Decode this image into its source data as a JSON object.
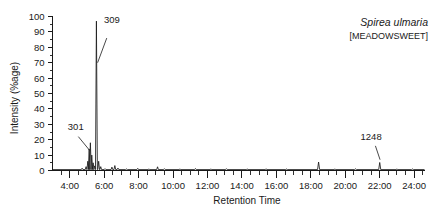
{
  "figure": {
    "species_name": "Spirea ulmaria",
    "common_name": "[MEADOWSWEET]"
  },
  "chart_data": {
    "type": "line",
    "title": "Spirea ulmaria",
    "subtitle": "[MEADOWSWEET]",
    "xlabel": "Retention Time",
    "ylabel": "Intensity (%age)",
    "xlim": [
      3.0,
      24.6
    ],
    "ylim": [
      0,
      100
    ],
    "grid": false,
    "legend": "none",
    "x_tick_labels": [
      "4:00",
      "6:00",
      "8:00",
      "10:00",
      "12:00",
      "14:00",
      "16:00",
      "18:00",
      "20:00",
      "22:00",
      "24:00"
    ],
    "x_tick_values": [
      4,
      6,
      8,
      10,
      12,
      14,
      16,
      18,
      20,
      22,
      24
    ],
    "x_minor_interval": 0.5,
    "y_tick_labels": [
      "0",
      "10",
      "20",
      "30",
      "40",
      "50",
      "60",
      "70",
      "80",
      "90",
      "100"
    ],
    "y_tick_values": [
      0,
      10,
      20,
      30,
      40,
      50,
      60,
      70,
      80,
      90,
      100
    ],
    "y_minor_interval": 5,
    "annotations": [
      {
        "label": "309",
        "x": 5.55,
        "y": 97,
        "label_x": 6.45,
        "label_y": 96,
        "leader_from_x": 6.15,
        "leader_from_y": 86,
        "leader_to_x": 5.62,
        "leader_to_y": 70
      },
      {
        "label": "301",
        "x": 5.2,
        "y": 18,
        "label_x": 4.35,
        "label_y": 26,
        "leader_from_x": 4.5,
        "leader_from_y": 22,
        "leader_to_x": 5.16,
        "leader_to_y": 13
      },
      {
        "label": "1248",
        "x": 22.0,
        "y": 5,
        "label_x": 21.5,
        "label_y": 20,
        "leader_from_x": 21.75,
        "leader_from_y": 16,
        "leader_to_x": 22.02,
        "leader_to_y": 7
      }
    ],
    "peaks": [
      {
        "x": 4.72,
        "y": 1.5,
        "w": 0.05
      },
      {
        "x": 4.95,
        "y": 2.5,
        "w": 0.05
      },
      {
        "x": 5.05,
        "y": 6.0,
        "w": 0.05
      },
      {
        "x": 5.13,
        "y": 14.0,
        "w": 0.05
      },
      {
        "x": 5.2,
        "y": 18.0,
        "w": 0.05
      },
      {
        "x": 5.28,
        "y": 10.0,
        "w": 0.05
      },
      {
        "x": 5.36,
        "y": 5.0,
        "w": 0.05
      },
      {
        "x": 5.44,
        "y": 3.0,
        "w": 0.05
      },
      {
        "x": 5.55,
        "y": 97.0,
        "w": 0.055
      },
      {
        "x": 5.68,
        "y": 6.0,
        "w": 0.05
      },
      {
        "x": 5.8,
        "y": 2.5,
        "w": 0.05
      },
      {
        "x": 6.05,
        "y": 1.2,
        "w": 0.05
      },
      {
        "x": 6.45,
        "y": 2.2,
        "w": 0.05
      },
      {
        "x": 6.62,
        "y": 3.2,
        "w": 0.05
      },
      {
        "x": 6.8,
        "y": 1.6,
        "w": 0.05
      },
      {
        "x": 7.3,
        "y": 1.0,
        "w": 0.05
      },
      {
        "x": 7.95,
        "y": 1.4,
        "w": 0.05
      },
      {
        "x": 8.6,
        "y": 1.0,
        "w": 0.05
      },
      {
        "x": 9.1,
        "y": 2.4,
        "w": 0.05
      },
      {
        "x": 9.5,
        "y": 1.2,
        "w": 0.05
      },
      {
        "x": 10.4,
        "y": 1.0,
        "w": 0.05
      },
      {
        "x": 11.3,
        "y": 1.3,
        "w": 0.05
      },
      {
        "x": 12.2,
        "y": 1.0,
        "w": 0.05
      },
      {
        "x": 13.1,
        "y": 1.2,
        "w": 0.05
      },
      {
        "x": 14.3,
        "y": 1.0,
        "w": 0.05
      },
      {
        "x": 15.4,
        "y": 1.1,
        "w": 0.05
      },
      {
        "x": 16.6,
        "y": 1.0,
        "w": 0.05
      },
      {
        "x": 18.45,
        "y": 5.5,
        "w": 0.06
      },
      {
        "x": 19.4,
        "y": 1.0,
        "w": 0.05
      },
      {
        "x": 20.6,
        "y": 1.1,
        "w": 0.05
      },
      {
        "x": 22.0,
        "y": 5.2,
        "w": 0.06
      },
      {
        "x": 23.0,
        "y": 1.0,
        "w": 0.05
      },
      {
        "x": 23.9,
        "y": 1.0,
        "w": 0.05
      }
    ]
  }
}
